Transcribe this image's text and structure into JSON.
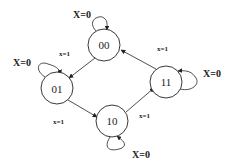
{
  "diagram": {
    "type": "state-diagram",
    "states": [
      {
        "id": "s00",
        "label": "00",
        "cx": 104,
        "cy": 45
      },
      {
        "id": "s01",
        "label": "01",
        "cx": 57,
        "cy": 88
      },
      {
        "id": "s10",
        "label": "10",
        "cx": 112,
        "cy": 121
      },
      {
        "id": "s11",
        "label": "11",
        "cx": 166,
        "cy": 82
      }
    ],
    "transitions": [
      {
        "from": "00",
        "to": "00",
        "label": "X=0"
      },
      {
        "from": "00",
        "to": "01",
        "label": "x=1"
      },
      {
        "from": "01",
        "to": "01",
        "label": "X=0"
      },
      {
        "from": "01",
        "to": "10",
        "label": "x=1"
      },
      {
        "from": "10",
        "to": "10",
        "label": "X=0"
      },
      {
        "from": "10",
        "to": "11",
        "label": "x=1"
      },
      {
        "from": "11",
        "to": "11",
        "label": "X=0"
      },
      {
        "from": "11",
        "to": "00",
        "label": "x=1"
      }
    ],
    "labels": {
      "self_00": "X=0",
      "edge_00_01": "x=1",
      "self_01": "X=0",
      "edge_01_10": "x=1",
      "self_10": "X=0",
      "edge_10_11": "x=1",
      "self_11": "X=0",
      "edge_11_00": "x=1"
    }
  }
}
